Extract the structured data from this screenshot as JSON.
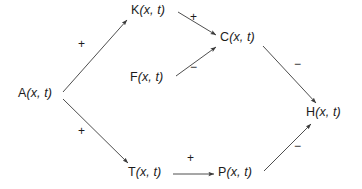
{
  "diagram": {
    "type": "signed-directed-graph",
    "background_color": "#ffffff",
    "stroke_color": "#3a3a3a",
    "text_color": "#1c1c1c",
    "nodes": [
      {
        "id": "A",
        "label": "A(x, t)",
        "base": "A",
        "args": "(x, t)",
        "x": 18,
        "y": 87
      },
      {
        "id": "K",
        "label": "K(x, t)",
        "base": "K",
        "args": "(x, t)",
        "x": 131,
        "y": 4
      },
      {
        "id": "C",
        "label": "C(x, t)",
        "base": "C",
        "args": "(x, t)",
        "x": 220,
        "y": 31
      },
      {
        "id": "F",
        "label": "F(x, t)",
        "base": "F",
        "args": "(x, t)",
        "x": 130,
        "y": 71
      },
      {
        "id": "H",
        "label": "H(x, t)",
        "base": "H",
        "args": "(x, t)",
        "x": 306,
        "y": 106
      },
      {
        "id": "T",
        "label": "T(x, t)",
        "base": "T",
        "args": "(x, t)",
        "x": 128,
        "y": 166
      },
      {
        "id": "P",
        "label": "P(x, t)",
        "base": "P",
        "args": "(x, t)",
        "x": 218,
        "y": 166
      }
    ],
    "edges": [
      {
        "id": "A-K",
        "from": "A",
        "to": "K",
        "sign": "+",
        "x1": 63,
        "y1": 92,
        "x2": 127,
        "y2": 20,
        "label_x": 78,
        "label_y": 38
      },
      {
        "id": "A-T",
        "from": "A",
        "to": "T",
        "sign": "+",
        "x1": 63,
        "y1": 99,
        "x2": 128,
        "y2": 163,
        "label_x": 78,
        "label_y": 125
      },
      {
        "id": "K-C",
        "from": "K",
        "to": "C",
        "sign": "+",
        "x1": 178,
        "y1": 12,
        "x2": 216,
        "y2": 35,
        "label_x": 190,
        "label_y": 11
      },
      {
        "id": "F-C",
        "from": "F",
        "to": "C",
        "sign": "−",
        "x1": 176,
        "y1": 76,
        "x2": 216,
        "y2": 47,
        "label_x": 190,
        "label_y": 61
      },
      {
        "id": "C-H",
        "from": "C",
        "to": "H",
        "sign": "−",
        "x1": 263,
        "y1": 46,
        "x2": 316,
        "y2": 103,
        "label_x": 294,
        "label_y": 58
      },
      {
        "id": "T-P",
        "from": "T",
        "to": "P",
        "sign": "+",
        "x1": 173,
        "y1": 174,
        "x2": 214,
        "y2": 174,
        "label_x": 187,
        "label_y": 152
      },
      {
        "id": "P-H",
        "from": "P",
        "to": "H",
        "sign": "−",
        "x1": 264,
        "y1": 171,
        "x2": 311,
        "y2": 124,
        "label_x": 294,
        "label_y": 140
      }
    ]
  }
}
